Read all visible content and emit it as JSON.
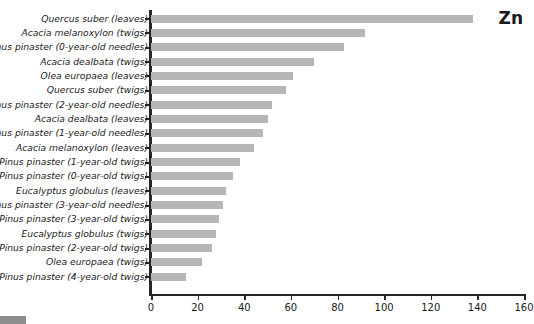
{
  "element_label": "Zn",
  "chart_data": {
    "type": "bar",
    "orientation": "horizontal",
    "title": "Zn",
    "xlabel": "",
    "ylabel": "",
    "xlim": [
      0,
      160
    ],
    "xticks": [
      0,
      20,
      40,
      60,
      80,
      100,
      120,
      140,
      160
    ],
    "grid": false,
    "legend": false,
    "bar_color": "#b6b6b6",
    "axis_color": "#262626",
    "categories": [
      "Quercus suber (leaves)",
      "Acacia melanoxylon (twigs)",
      "Pinus pinaster (0-year-old needles)",
      "Acacia dealbata (twigs)",
      "Olea europaea (leaves)",
      "Quercus suber (twigs)",
      "Pinus pinaster (2-year-old needles)",
      "Acacia dealbata (leaves)",
      "Pinus pinaster (1-year-old needles)",
      "Acacia melanoxylon (leaves)",
      "Pinus pinaster (1-year-old twigs)",
      "Pinus pinaster (0-year-old twigs)",
      "Eucalyptus globulus (leaves)",
      "Pinus pinaster (3-year-old needles)",
      "Pinus pinaster (3-year-old twigs)",
      "Eucalyptus globulus (twigs)",
      "Pinus pinaster (2-year-old twigs)",
      "Olea europaea (twigs)",
      "Pinus pinaster (4-year-old twigs)"
    ],
    "values": [
      138,
      92,
      83,
      70,
      61,
      58,
      52,
      50,
      48,
      44,
      38,
      35,
      32,
      31,
      29,
      28,
      26,
      22,
      15
    ]
  }
}
